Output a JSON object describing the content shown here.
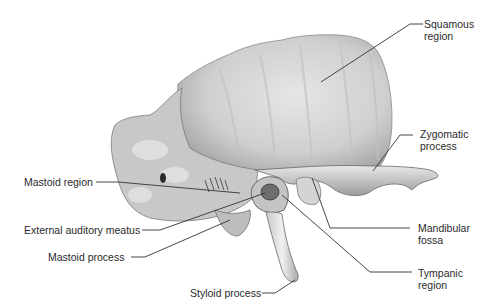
{
  "figure": {
    "colors": {
      "background": "#ffffff",
      "bone_light": "#dcdcdc",
      "bone_mid": "#b8b8b8",
      "bone_dark": "#6e6e6e",
      "leader_line": "#333333",
      "label_text": "#2a2a2a"
    },
    "labels": {
      "squamous": [
        "Squamous",
        "region"
      ],
      "zygomatic": [
        "Zygomatic",
        "process"
      ],
      "mandibular": [
        "Mandibular",
        "fossa"
      ],
      "tympanic": [
        "Tympanic",
        "region"
      ],
      "mastoid_region": "Mastoid region",
      "external_auditory_meatus": "External auditory meatus",
      "mastoid_process": "Mastoid process",
      "styloid_process": "Styloid process"
    }
  }
}
